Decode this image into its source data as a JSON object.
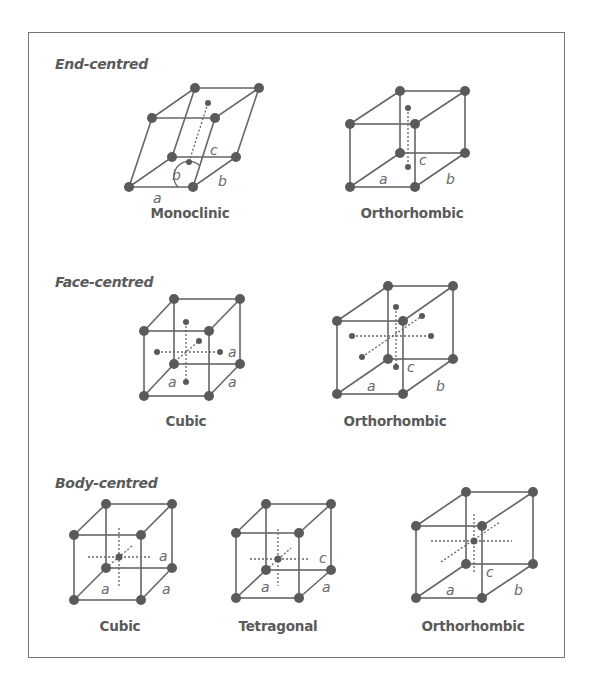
{
  "colors": {
    "line": "#666666",
    "atom": "#5a5a5a",
    "text": "#5a5a5a",
    "frame": "#777777"
  },
  "sections": [
    {
      "title": "End-centred",
      "lattices": [
        {
          "name": "Monoclinic",
          "labels": [
            "a",
            "b",
            "b",
            "c"
          ]
        },
        {
          "name": "Orthorhombic",
          "labels": [
            "a",
            "b",
            "c"
          ]
        }
      ]
    },
    {
      "title": "Face-centred",
      "lattices": [
        {
          "name": "Cubic",
          "labels": [
            "a",
            "a",
            "a"
          ]
        },
        {
          "name": "Orthorhombic",
          "labels": [
            "a",
            "b",
            "c"
          ]
        }
      ]
    },
    {
      "title": "Body-centred",
      "lattices": [
        {
          "name": "Cubic",
          "labels": [
            "a",
            "a",
            "a"
          ]
        },
        {
          "name": "Tetragonal",
          "labels": [
            "a",
            "a",
            "c"
          ]
        },
        {
          "name": "Orthorhombic",
          "labels": [
            "a",
            "b",
            "c"
          ]
        }
      ]
    }
  ]
}
